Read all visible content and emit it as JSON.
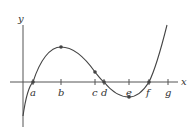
{
  "axes": {
    "x_label": "x",
    "y_label": "y"
  },
  "points": [
    {
      "label": "a",
      "x": 33,
      "tick": true,
      "dot_y": 82
    },
    {
      "label": "b",
      "x": 61,
      "tick": true,
      "dot_y": 47
    },
    {
      "label": "c",
      "x": 95,
      "tick": true,
      "dot_y": 72
    },
    {
      "label": "d",
      "x": 104,
      "tick": true,
      "dot_y": 82
    },
    {
      "label": "e",
      "x": 129,
      "tick": true,
      "dot_y": 97
    },
    {
      "label": "f",
      "x": 149,
      "tick": true,
      "dot_y": 82
    },
    {
      "label": "g",
      "x": 168,
      "tick": true,
      "dot_y": null
    }
  ],
  "colors": {
    "curve": "#444444",
    "axis": "#555555",
    "dot": "#444444"
  }
}
